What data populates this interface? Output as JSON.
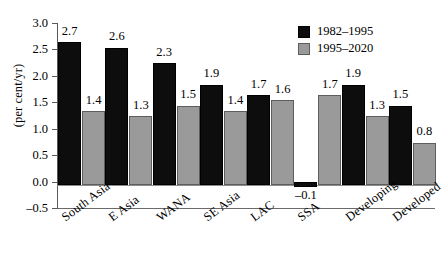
{
  "chart_data": {
    "type": "bar",
    "title": "",
    "subtitle": "",
    "xlabel": "",
    "ylabel": "(per cent/yr)",
    "ylim": [
      -0.5,
      3.0
    ],
    "ytick_labels": [
      "3.0",
      "2.5",
      "2.0",
      "1.5",
      "1.0",
      "0.5",
      "0.0",
      "–0.5"
    ],
    "ytick_values": [
      3.0,
      2.5,
      2.0,
      1.5,
      1.0,
      0.5,
      0.0,
      -0.5
    ],
    "grid": false,
    "legend_position": "top-right",
    "categories": [
      "South Asia",
      "E Asia",
      "WANA",
      "SE Asia",
      "LAC",
      "SSA",
      "Developing",
      "Developed"
    ],
    "series": [
      {
        "name": "1982–1995",
        "color": "#0d0d0d",
        "values": [
          2.7,
          2.6,
          2.3,
          1.9,
          1.7,
          -0.1,
          1.9,
          1.5
        ],
        "labels": [
          "2.7",
          "2.6",
          "2.3",
          "1.9",
          "1.7",
          "–0.1",
          "1.9",
          "1.5"
        ]
      },
      {
        "name": "1995–2020",
        "color": "#9a9a9a",
        "values": [
          1.4,
          1.3,
          1.5,
          1.4,
          1.6,
          1.7,
          1.3,
          0.8
        ],
        "labels": [
          "1.4",
          "1.3",
          "1.5",
          "1.4",
          "1.6",
          "1.7",
          "1.3",
          "0.8"
        ]
      }
    ]
  }
}
